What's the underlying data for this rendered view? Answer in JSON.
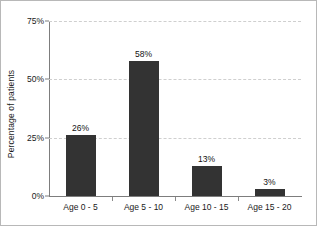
{
  "chart_data": {
    "type": "bar",
    "title": "",
    "subtitle": "",
    "xlabel": "",
    "ylabel": "Percentage of patients",
    "categories": [
      "Age 0 - 5",
      "Age 5 - 10",
      "Age 10 - 15",
      "Age 15 - 20"
    ],
    "values": [
      26,
      58,
      13,
      3
    ],
    "data_labels": [
      "26%",
      "58%",
      "13%",
      "3%"
    ],
    "ylim": [
      0,
      75
    ],
    "y_ticks": [
      0,
      25,
      50,
      75
    ],
    "y_tick_labels": [
      "0%",
      "25%",
      "50%",
      "75%"
    ],
    "grid": "horizontal-dashed",
    "legend": "none",
    "bar_color": "#333333",
    "gridline_color": "#cfcfcf",
    "axis_color": "#7d7d7d",
    "background_color": "#ffffff",
    "border_color": "#b8b8b8",
    "text_color": "#1a1a1a"
  }
}
